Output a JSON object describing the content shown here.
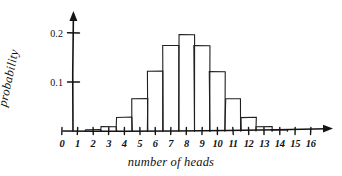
{
  "chart_data": {
    "type": "bar",
    "title": "",
    "subtitle": "",
    "xlabel": "number of heads",
    "ylabel": "probability",
    "categories": [
      "0",
      "1",
      "2",
      "3",
      "4",
      "5",
      "6",
      "7",
      "8",
      "9",
      "10",
      "11",
      "12",
      "13",
      "14",
      "15",
      "16"
    ],
    "values": [
      0.0,
      0.0,
      0.002,
      0.009,
      0.028,
      0.066,
      0.122,
      0.175,
      0.196,
      0.175,
      0.122,
      0.066,
      0.028,
      0.009,
      0.002,
      0.0,
      0.0
    ],
    "xlim": [
      -0.5,
      16.5
    ],
    "ylim": [
      0,
      0.23
    ],
    "y_ticks": [
      0.1,
      0.2
    ],
    "y_tick_labels": [
      "0.1",
      "0.2"
    ],
    "x_ticks": [
      0,
      1,
      2,
      3,
      4,
      5,
      6,
      7,
      8,
      9,
      10,
      11,
      12,
      13,
      14,
      15,
      16
    ],
    "grid": false,
    "legend": null,
    "legend_position": "none",
    "style": "hand-drawn",
    "bar_fill": "none",
    "ink_color": "#1a1a1a",
    "background_color": "#ffffff",
    "annotations": []
  },
  "axes": {
    "y_arrow": "up-arrow-icon",
    "x_arrow": "right-arrow-icon"
  }
}
